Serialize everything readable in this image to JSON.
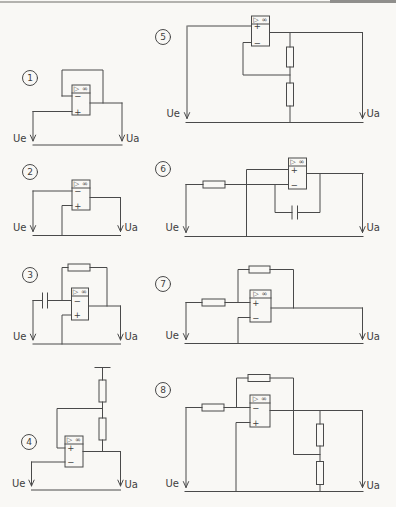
{
  "page": {
    "kind": "scanned worksheet of operational-amplifier circuits",
    "paper_color": "#f9f8f5",
    "ink_color": "#4a4a4a",
    "scan_edge_color": "#a9a8a4"
  },
  "symbols": {
    "opamp_header": "▷ ∞",
    "plus": "+",
    "minus": "−"
  },
  "labels": {
    "input": "Ue",
    "output": "Ua"
  },
  "circuits": [
    {
      "number": "1",
      "pins": [
        "−",
        "+"
      ],
      "topology": "output fed back directly to − input; Ue on + input (voltage follower)"
    },
    {
      "number": "2",
      "pins": [
        "−",
        "+"
      ],
      "topology": "Ue on − input, + input to common rail, no feedback (comparator)"
    },
    {
      "number": "3",
      "pins": [
        "−",
        "+"
      ],
      "topology": "Ue through series capacitor to − input, resistor feedback (differentiator)"
    },
    {
      "number": "4",
      "pins": [
        "+",
        "−"
      ],
      "topology": "two-resistor divider from top terminal to output feeds + input; Ue on − input (Schmitt trigger)"
    },
    {
      "number": "5",
      "pins": [
        "+",
        "−"
      ],
      "topology": "Ue on + input; output voltage divider feeds − input (non-inverting amplifier)"
    },
    {
      "number": "6",
      "pins": [
        "+",
        "−"
      ],
      "topology": "Ue through series resistor to − input, capacitor feedback, + input to common rail (integrator)"
    },
    {
      "number": "7",
      "pins": [
        "+",
        "−"
      ],
      "topology": "Ue through series resistor to + input, resistor feedback to + input, − input to common rail"
    },
    {
      "number": "8",
      "pins": [
        "−",
        "+"
      ],
      "topology": "Ue through series resistor to − input, resistor feedback from tap of output divider, + input to common rail"
    }
  ]
}
